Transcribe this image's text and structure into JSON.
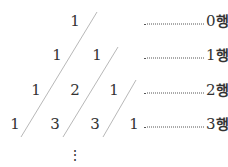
{
  "rows": [
    {
      "values": [
        "1"
      ],
      "label_num": "0",
      "label_suffix": "행"
    },
    {
      "values": [
        "1",
        "1"
      ],
      "label_num": "1",
      "label_suffix": "행"
    },
    {
      "values": [
        "1",
        "2",
        "1"
      ],
      "label_num": "2",
      "label_suffix": "행"
    },
    {
      "values": [
        "1",
        "3",
        "3",
        "1"
      ],
      "label_num": "3",
      "label_suffix": "행"
    }
  ],
  "continuation": "⋮",
  "colors": {
    "text": "#333333",
    "diagonal": "#bbbbbb",
    "dots": "#555555"
  }
}
